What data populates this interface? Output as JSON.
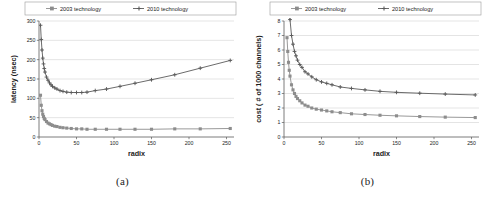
{
  "figure": {
    "panels": [
      {
        "caption": "(a)",
        "legend": {
          "position": "top",
          "entries": [
            {
              "label": "2003 technology",
              "marker": "square-marker",
              "color": "#8d8d8d"
            },
            {
              "label": "2010 technology",
              "marker": "cross-marker",
              "color": "#5a5a5a"
            }
          ]
        },
        "chart_data": {
          "type": "line",
          "title": "",
          "subtitle": "",
          "xlabel": "radix",
          "ylabel": "latency (nsec)",
          "xlim": [
            0,
            260
          ],
          "ylim": [
            0,
            300
          ],
          "xticks": [
            0,
            50,
            100,
            150,
            200,
            250
          ],
          "yticks": [
            0,
            50,
            100,
            150,
            200,
            250,
            300
          ],
          "grid": "horizontal",
          "legend_position": "top",
          "series": [
            {
              "name": "2010 technology",
              "color": "#5a5a5a",
              "marker": "cross-marker",
              "x": [
                2,
                3,
                4,
                5,
                6,
                7,
                8,
                10,
                12,
                14,
                16,
                18,
                21,
                24,
                28,
                32,
                37,
                43,
                50,
                57,
                64,
                75,
                90,
                108,
                128,
                150,
                181,
                215,
                255
              ],
              "y": [
                289,
                252,
                225,
                204,
                189,
                177,
                168,
                155,
                147,
                140,
                135,
                131,
                127,
                124,
                120,
                118,
                116,
                115,
                115,
                115,
                116,
                120,
                124,
                131,
                139,
                148,
                161,
                178,
                198
              ]
            },
            {
              "name": "2003 technology",
              "color": "#8d8d8d",
              "marker": "square-marker",
              "x": [
                2,
                3,
                4,
                5,
                6,
                7,
                8,
                10,
                12,
                14,
                16,
                18,
                21,
                24,
                28,
                32,
                37,
                43,
                50,
                57,
                64,
                75,
                90,
                108,
                128,
                150,
                181,
                215,
                255
              ],
              "y": [
                108,
                82,
                68,
                59,
                53,
                48,
                45,
                40,
                36,
                34,
                32,
                30,
                28,
                27,
                25,
                24,
                23,
                22,
                21,
                21,
                20,
                20,
                20,
                20,
                20,
                20,
                21,
                21,
                22
              ]
            }
          ]
        }
      },
      {
        "caption": "(b)",
        "legend": {
          "position": "top",
          "entries": [
            {
              "label": "2003 technology",
              "marker": "square-marker",
              "color": "#8d8d8d"
            },
            {
              "label": "2010 technology",
              "marker": "cross-marker",
              "color": "#5a5a5a"
            }
          ]
        },
        "chart_data": {
          "type": "line",
          "title": "",
          "subtitle": "",
          "xlabel": "radix",
          "ylabel": "cost ( # of 1000 channels)",
          "xlim": [
            0,
            260
          ],
          "ylim": [
            0,
            8
          ],
          "xticks": [
            0,
            50,
            100,
            150,
            200,
            250
          ],
          "yticks": [
            0,
            1,
            2,
            3,
            4,
            5,
            6,
            7,
            8
          ],
          "grid": "horizontal",
          "legend_position": "top",
          "series": [
            {
              "name": "2010 technology",
              "color": "#5a5a5a",
              "marker": "cross-marker",
              "x": [
                4,
                5,
                6,
                7,
                8,
                10,
                12,
                14,
                16,
                18,
                21,
                24,
                28,
                32,
                37,
                43,
                50,
                57,
                64,
                75,
                90,
                108,
                128,
                150,
                181,
                215,
                255
              ],
              "y": [
                12.6,
                10.9,
                9.6,
                8.8,
                8.1,
                7.0,
                6.4,
                5.9,
                5.6,
                5.3,
                5.0,
                4.8,
                4.5,
                4.35,
                4.15,
                3.95,
                3.8,
                3.7,
                3.6,
                3.45,
                3.35,
                3.25,
                3.15,
                3.08,
                3.02,
                2.96,
                2.9
              ]
            },
            {
              "name": "2003 technology",
              "color": "#8d8d8d",
              "marker": "square-marker",
              "x": [
                4,
                5,
                6,
                7,
                8,
                10,
                12,
                14,
                16,
                18,
                21,
                24,
                28,
                32,
                37,
                43,
                50,
                57,
                64,
                75,
                90,
                108,
                128,
                150,
                181,
                215,
                255
              ],
              "y": [
                6.85,
                5.9,
                5.15,
                4.6,
                4.2,
                3.6,
                3.25,
                3.0,
                2.8,
                2.65,
                2.5,
                2.35,
                2.2,
                2.12,
                2.0,
                1.92,
                1.86,
                1.8,
                1.74,
                1.68,
                1.6,
                1.55,
                1.5,
                1.46,
                1.41,
                1.37,
                1.34
              ]
            }
          ]
        }
      }
    ]
  }
}
